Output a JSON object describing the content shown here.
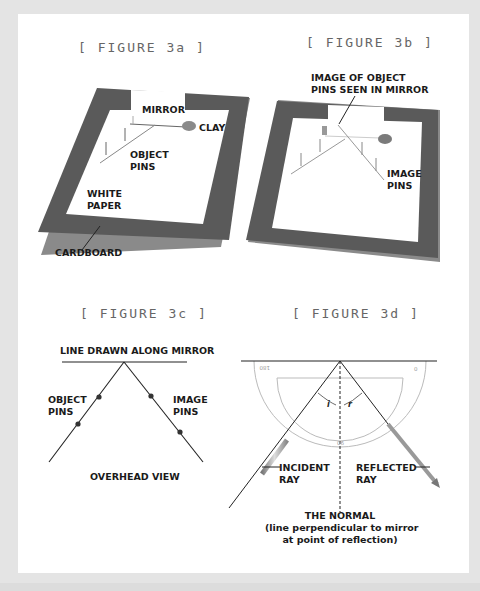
{
  "figures": {
    "fig3a": {
      "title": "[ FIGURE 3a ]",
      "labels": {
        "mirror": "MIRROR",
        "clay": "CLAY",
        "object_pins": "OBJECT\nPINS",
        "white_paper": "WHITE\nPAPER",
        "cardboard": "CARDBOARD"
      }
    },
    "fig3b": {
      "title": "[ FIGURE 3b ]",
      "labels": {
        "image_of_object_pins": "IMAGE OF OBJECT\nPINS SEEN IN MIRROR",
        "image_pins": "IMAGE\nPINS"
      }
    },
    "fig3c": {
      "title": "[ FIGURE 3c ]",
      "labels": {
        "line_along_mirror": "LINE DRAWN ALONG MIRROR",
        "object_pins": "OBJECT\nPINS",
        "image_pins": "IMAGE\nPINS",
        "overhead_view": "OVERHEAD VIEW"
      }
    },
    "fig3d": {
      "title": "[ FIGURE 3d ]",
      "labels": {
        "incident_ray": "INCIDENT\nRAY",
        "reflected_ray": "REFLECTED\nRAY",
        "the_normal": "THE NORMAL",
        "normal_desc": "(line perpendicular to mirror\nat point of reflection)",
        "angle_i": "i",
        "angle_r": "r"
      },
      "protractor_ticks": {
        "left": "180",
        "right": "0",
        "bottom": "90"
      }
    }
  },
  "colors": {
    "background": "#e4e4e4",
    "card": "#ffffff",
    "cardboard": "#555555",
    "title_text": "#666666",
    "label_text": "#1a1a1a",
    "protractor": "#bbbbbb"
  }
}
